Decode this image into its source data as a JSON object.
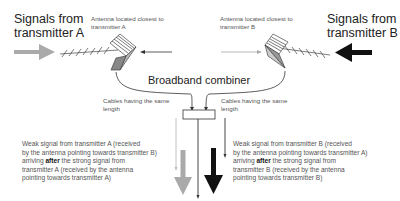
{
  "transmitter_a": {
    "title_line1": "Signals from",
    "title_line2": "transmitter A",
    "antenna_label_line1": "Antenna located closest to",
    "antenna_label_line2": "transmitter A",
    "arrow_color": "#aaaaaa"
  },
  "transmitter_b": {
    "title_line1": "Signals from",
    "title_line2": "transmitter B",
    "antenna_label_line1": "Antenna located closest to",
    "antenna_label_line2": "transmitter B",
    "arrow_color": "#111111"
  },
  "combiner": {
    "label": "Broadband combiner"
  },
  "cables": {
    "left_line1": "Cables having the same",
    "left_line2": "length",
    "right_line1": "Cables having the same",
    "right_line2": "length"
  },
  "notes": {
    "left": {
      "line1": "Weak signal from transmitter A (received",
      "line2": "by the antenna pointing towards transmitter B)",
      "line3_pre": "arriving ",
      "line3_bold": "after",
      "line3_post": " the strong signal from",
      "line4": "transmitter A (received by the antenna",
      "line5": "pointing towards transmitter A)"
    },
    "right": {
      "line1": "Weak signal from transmitter B (received",
      "line2": "by the antenna pointing towards transmitter A)",
      "line3_pre": "arriving ",
      "line3_bold": "after",
      "line3_post": " the strong signal from",
      "line4": "transmitter B (received by the antenna",
      "line5": "pointing towards transmitter B)"
    }
  }
}
